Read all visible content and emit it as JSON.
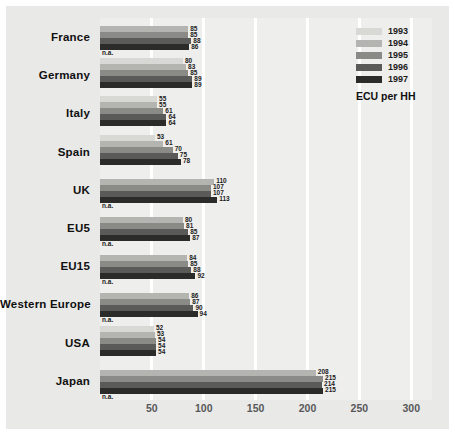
{
  "chart_data": {
    "type": "bar",
    "orientation": "horizontal",
    "title": "",
    "xlabel": "",
    "ylabel": "",
    "unit_label": "ECU per HH",
    "xlim": [
      0,
      320
    ],
    "xticks": [
      50,
      100,
      150,
      200,
      250,
      300
    ],
    "xtick_labels": [
      "50",
      "100",
      "150",
      "200",
      "250",
      "300"
    ],
    "grid": true,
    "legend_position": "top-right",
    "missing_label": "n.a.",
    "categories": [
      "France",
      "Germany",
      "Italy",
      "Spain",
      "UK",
      "EU5",
      "EU15",
      "Western Europe",
      "USA",
      "Japan"
    ],
    "series": [
      {
        "name": "1993",
        "color": "#d8d8d4",
        "values": [
          null,
          80,
          55,
          53,
          null,
          null,
          null,
          null,
          52,
          null
        ]
      },
      {
        "name": "1994",
        "color": "#b4b4b0",
        "values": [
          85,
          83,
          55,
          61,
          110,
          80,
          84,
          86,
          53,
          208
        ]
      },
      {
        "name": "1995",
        "color": "#8a8a86",
        "values": [
          85,
          85,
          61,
          70,
          107,
          81,
          85,
          87,
          54,
          215
        ]
      },
      {
        "name": "1996",
        "color": "#5a5a58",
        "values": [
          88,
          89,
          64,
          75,
          107,
          85,
          88,
          90,
          54,
          214
        ]
      },
      {
        "name": "1997",
        "color": "#2b2b2a",
        "values": [
          86,
          89,
          64,
          78,
          113,
          87,
          92,
          94,
          54,
          215
        ]
      }
    ],
    "value_labels": {
      "France": [
        "n.a.",
        "85",
        "85",
        "88",
        "86"
      ],
      "Germany": [
        "80",
        "83",
        "85",
        "89",
        "89"
      ],
      "Italy": [
        "55",
        "55",
        "61",
        "64",
        "64"
      ],
      "Spain": [
        "53",
        "61",
        "70",
        "75",
        "78"
      ],
      "UK": [
        "n.a.",
        "110",
        "107",
        "107",
        "113"
      ],
      "EU5": [
        "n.a.",
        "80",
        "81",
        "85",
        "87"
      ],
      "EU15": [
        "n.a.",
        "84",
        "85",
        "88",
        "92"
      ],
      "Western Europe": [
        "n.a.",
        "86",
        "87",
        "90",
        "94"
      ],
      "USA": [
        "52",
        "53",
        "54",
        "54",
        "54"
      ],
      "Japan": [
        "n.a.",
        "208",
        "215",
        "214",
        "215"
      ]
    }
  },
  "legend": {
    "items": [
      {
        "label": "1993"
      },
      {
        "label": "1994"
      },
      {
        "label": "1995"
      },
      {
        "label": "1996"
      },
      {
        "label": "1997"
      }
    ],
    "unit": "ECU per HH"
  }
}
